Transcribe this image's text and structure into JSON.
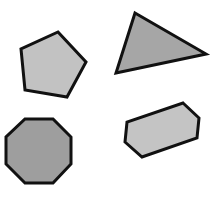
{
  "canvas": {
    "width": 218,
    "height": 207,
    "background": "#ffffff"
  },
  "stroke": {
    "color": "#111111",
    "width": 3
  },
  "shapes": [
    {
      "name": "pentagon",
      "sides": 5,
      "fill": "#c2c2c2",
      "points": "58,32 86,62 67,97 25,90 21,49"
    },
    {
      "name": "triangle",
      "sides": 3,
      "fill": "#a6a6a6",
      "points": "135,13 206,54 116,73"
    },
    {
      "name": "octagon",
      "sides": 8,
      "fill": "#9e9e9e",
      "points": "25,119 53,119 71,137 71,164 53,183 25,183 6,164 6,137"
    },
    {
      "name": "hexagon",
      "sides": 6,
      "fill": "#c4c4c4",
      "points": "183,103 199,118 197,138 142,157 125,142 127,122"
    }
  ]
}
